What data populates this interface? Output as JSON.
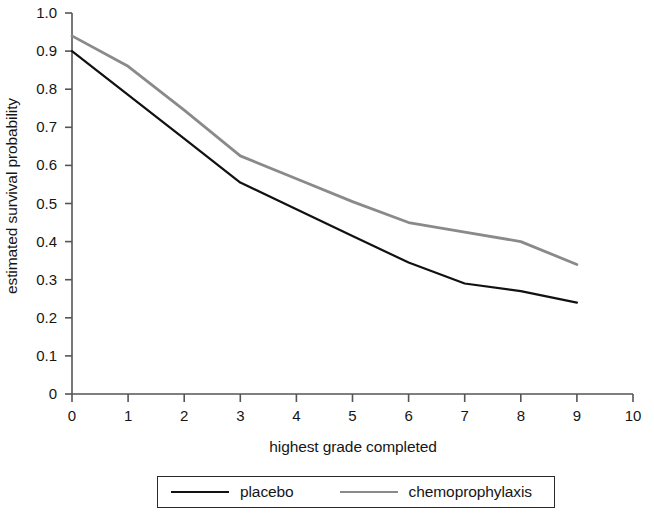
{
  "chart_data": {
    "type": "line",
    "title": "",
    "xlabel": "highest grade completed",
    "ylabel": "estimated survival probability",
    "xlim": [
      0,
      10
    ],
    "ylim": [
      0,
      1.0
    ],
    "grid": false,
    "legend_position": "bottom-center",
    "x_ticks": [
      "0",
      "1",
      "2",
      "3",
      "4",
      "5",
      "6",
      "7",
      "8",
      "9",
      "10"
    ],
    "x_tick_values": [
      0,
      1,
      2,
      3,
      4,
      5,
      6,
      7,
      8,
      9,
      10
    ],
    "y_ticks": [
      "0",
      "0.1",
      "0.2",
      "0.3",
      "0.4",
      "0.5",
      "0.6",
      "0.7",
      "0.8",
      "0.9",
      "1.0"
    ],
    "y_tick_values": [
      0,
      0.1,
      0.2,
      0.3,
      0.4,
      0.5,
      0.6,
      0.7,
      0.8,
      0.9,
      1.0
    ],
    "x": [
      0,
      1,
      2,
      3,
      4,
      5,
      6,
      7,
      8,
      9
    ],
    "series": [
      {
        "name": "placebo",
        "color": "#111111",
        "width": 2.2,
        "values": [
          0.9,
          0.785,
          0.67,
          0.555,
          0.485,
          0.415,
          0.345,
          0.29,
          0.27,
          0.24
        ]
      },
      {
        "name": "chemoprophylaxis",
        "color": "#8a8a8a",
        "width": 2.8,
        "values": [
          0.94,
          0.86,
          0.745,
          0.625,
          0.565,
          0.505,
          0.45,
          0.425,
          0.4,
          0.34
        ]
      }
    ]
  },
  "legend": {
    "items": [
      {
        "label": "placebo",
        "style": "solid-black"
      },
      {
        "label": "chemoprophylaxis",
        "style": "solid-gray"
      }
    ]
  },
  "axes": {
    "axis_color": "#555555",
    "tick_color": "#555555"
  }
}
